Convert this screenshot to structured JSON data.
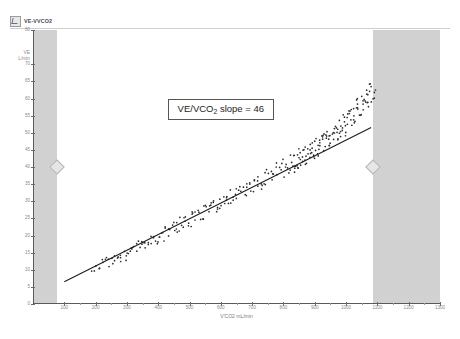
{
  "window": {
    "title": "VE-VVCO2",
    "icon": "chart-window-icon"
  },
  "annotation": {
    "prefix": "VE/VCO",
    "subscript": "2",
    "suffix": " slope = 46"
  },
  "chart_data": {
    "type": "scatter",
    "title": "VE-VVCO2",
    "xlabel": "V'CO2 mL/min",
    "ylabel": "VE\nL/min",
    "ylabel_line1": "VE",
    "ylabel_line2": "L/min",
    "xlim": [
      0,
      1300
    ],
    "ylim": [
      0,
      80
    ],
    "grid": false,
    "legend": null,
    "xticks": [
      100,
      200,
      300,
      400,
      500,
      600,
      700,
      800,
      900,
      1000,
      1100,
      1200,
      1300
    ],
    "xtick_labels": [
      "100",
      "200",
      "300",
      "400",
      "500",
      "600",
      "700",
      "800",
      "900",
      "1000",
      "1100",
      "1200",
      "1300"
    ],
    "yticks": [
      0,
      5,
      10,
      15,
      20,
      25,
      30,
      35,
      40,
      45,
      50,
      55,
      60,
      65,
      70,
      80
    ],
    "ytick_labels": [
      "0",
      "5",
      "10",
      "15",
      "20",
      "25",
      "30",
      "35",
      "40",
      "45",
      "50",
      "55",
      "60",
      "65",
      "70",
      "80"
    ],
    "annotations": [
      {
        "text": "VE/VCO2 slope = 46",
        "x": 430,
        "y": 57,
        "boxed": true
      }
    ],
    "shaded_regions": [
      {
        "name": "left-exclusion-band",
        "x0": 0,
        "x1": 77,
        "color": "#c9c9c9"
      },
      {
        "name": "right-exclusion-band",
        "x0": 1087,
        "x1": 1300,
        "color": "#c9c9c9"
      }
    ],
    "handles": [
      {
        "name": "left-range-handle",
        "x": 77,
        "y": 40
      },
      {
        "name": "right-range-handle",
        "x": 1087,
        "y": 40
      }
    ],
    "fit_line": {
      "name": "VE/VCO2 regression line",
      "slope": 46,
      "slope_units": "VE per 1000 mL/min VCO2",
      "x0": 100,
      "y0": 6.5,
      "x1": 1080,
      "y1": 51.5
    },
    "series": [
      {
        "name": "VE vs V'CO2 breath-by-breath",
        "marker": "dot",
        "color": "#2b2b2b",
        "x": [
          192,
          198,
          205,
          209,
          214,
          219,
          224,
          228,
          233,
          238,
          243,
          248,
          252,
          257,
          261,
          266,
          270,
          275,
          279,
          284,
          288,
          293,
          297,
          302,
          306,
          311,
          315,
          320,
          324,
          328,
          333,
          337,
          341,
          345,
          350,
          354,
          358,
          362,
          366,
          370,
          374,
          378,
          382,
          386,
          390,
          394,
          398,
          402,
          406,
          410,
          414,
          418,
          422,
          426,
          430,
          434,
          438,
          442,
          446,
          450,
          454,
          458,
          462,
          466,
          470,
          474,
          478,
          482,
          486,
          490,
          494,
          498,
          502,
          506,
          510,
          514,
          518,
          522,
          526,
          530,
          534,
          538,
          542,
          546,
          550,
          554,
          558,
          562,
          566,
          570,
          574,
          578,
          582,
          586,
          590,
          594,
          598,
          602,
          606,
          610,
          614,
          618,
          622,
          626,
          630,
          634,
          638,
          642,
          646,
          650,
          654,
          658,
          662,
          666,
          670,
          674,
          678,
          682,
          686,
          690,
          694,
          698,
          702,
          706,
          710,
          714,
          718,
          722,
          726,
          730,
          734,
          738,
          742,
          746,
          750,
          754,
          758,
          762,
          766,
          770,
          774,
          778,
          782,
          786,
          790,
          794,
          798,
          802,
          806,
          810,
          814,
          818,
          822,
          826,
          830,
          834,
          838,
          842,
          846,
          850,
          854,
          858,
          862,
          866,
          870,
          874,
          878,
          882,
          886,
          890,
          894,
          898,
          902,
          906,
          910,
          914,
          918,
          922,
          926,
          930,
          934,
          938,
          942,
          946,
          950,
          954,
          958,
          962,
          966,
          970,
          974,
          978,
          982,
          986,
          990,
          994,
          998,
          1002,
          1006,
          1010,
          1014,
          1018,
          1022,
          1026,
          1030,
          1034,
          1038,
          1042,
          1046,
          1050,
          1054,
          1058,
          1062,
          1066,
          1070,
          1074,
          1078,
          1082,
          1086,
          1090
        ],
        "y": [
          10.2,
          10.5,
          10.8,
          10.4,
          11.1,
          11.4,
          11.0,
          11.7,
          12.0,
          11.6,
          12.3,
          12.6,
          12.2,
          12.9,
          13.2,
          12.8,
          13.5,
          13.8,
          13.4,
          14.1,
          14.4,
          14.0,
          14.7,
          15.0,
          14.6,
          15.3,
          15.6,
          15.2,
          15.9,
          16.2,
          15.8,
          16.5,
          16.8,
          16.4,
          17.1,
          17.4,
          17.0,
          17.7,
          18.0,
          17.6,
          18.3,
          18.6,
          18.2,
          18.9,
          19.2,
          18.8,
          19.5,
          19.8,
          19.4,
          20.1,
          20.4,
          20.0,
          20.7,
          21.0,
          20.6,
          21.3,
          21.6,
          21.2,
          21.9,
          22.2,
          21.8,
          22.5,
          22.8,
          22.4,
          23.1,
          23.4,
          23.0,
          23.7,
          24.0,
          23.6,
          24.3,
          24.6,
          24.2,
          24.9,
          25.2,
          24.8,
          25.5,
          25.8,
          25.4,
          26.1,
          26.4,
          26.0,
          26.7,
          27.0,
          26.6,
          27.3,
          27.6,
          27.2,
          27.9,
          28.2,
          27.8,
          28.5,
          28.8,
          28.4,
          29.1,
          29.4,
          29.0,
          29.7,
          30.0,
          29.6,
          30.3,
          30.6,
          30.2,
          30.9,
          31.2,
          30.8,
          31.5,
          31.8,
          31.4,
          32.1,
          32.4,
          32.0,
          32.7,
          33.0,
          32.6,
          33.3,
          33.6,
          33.2,
          33.9,
          34.2,
          33.8,
          34.5,
          34.8,
          34.4,
          35.1,
          35.4,
          35.0,
          35.7,
          36.0,
          35.6,
          36.3,
          36.6,
          36.2,
          36.9,
          37.2,
          36.8,
          37.5,
          37.8,
          37.4,
          38.1,
          38.4,
          38.0,
          38.7,
          39.0,
          38.6,
          39.3,
          39.6,
          39.2,
          39.9,
          40.2,
          39.8,
          40.5,
          40.8,
          40.4,
          41.1,
          41.4,
          41.0,
          41.7,
          42.0,
          41.6,
          42.3,
          42.6,
          42.2,
          42.9,
          43.2,
          42.8,
          43.5,
          43.8,
          43.4,
          44.1,
          44.4,
          44.0,
          44.7,
          45.0,
          44.6,
          45.3,
          45.6,
          45.2,
          45.9,
          46.2,
          45.8,
          46.5,
          46.8,
          46.4,
          47.1,
          47.4,
          47.0,
          47.7,
          48.0,
          47.6,
          48.3,
          48.6,
          48.2,
          48.9,
          49.2,
          48.8,
          49.5,
          49.8,
          49.4,
          50.1,
          50.4,
          50.0,
          50.7,
          51.0,
          50.6,
          51.3,
          51.6,
          51.2,
          51.9,
          52.2,
          51.8,
          52.5,
          52.8,
          52.4,
          53.1,
          53.4,
          53.0,
          53.7,
          54.0,
          53.6
        ]
      }
    ]
  }
}
